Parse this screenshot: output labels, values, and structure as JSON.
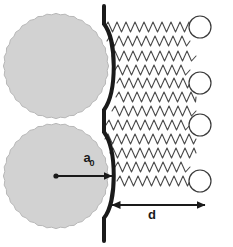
{
  "figure": {
    "width": 233,
    "height": 247,
    "background_color": "#ffffff"
  },
  "labels": {
    "radius": {
      "symbol": "a",
      "subscript": "0",
      "full": "a0",
      "x": 87,
      "y": 162
    },
    "distance": {
      "symbol": "d",
      "full": "d",
      "x": 152,
      "y": 219
    }
  },
  "colors": {
    "sphere_fill": "#d2d2d2",
    "sphere_edge": "#b8b8b8",
    "wall": "#1a1a1a",
    "chain": "#4a4a4a",
    "end_group_stroke": "#3a3a3a",
    "end_group_fill": "#ffffff",
    "arrow": "#1a1a1a",
    "label": "#1a1a1a"
  },
  "spheres": [
    {
      "name": "upper-sphere",
      "cx": 56,
      "cy": 66,
      "r": 52
    },
    {
      "name": "lower-sphere",
      "cx": 56,
      "cy": 176,
      "r": 52
    }
  ],
  "wall": {
    "name": "membrane-wall",
    "stroke_width": 4,
    "top_x": 104,
    "top_y": 6,
    "bottom_x": 104,
    "bottom_y": 241,
    "bulge_x": 117
  },
  "radius_arrow": {
    "name": "radius-arrow",
    "from_x": 56,
    "from_y": 176,
    "to_x": 112,
    "to_y": 176,
    "has_dot_origin": true,
    "head": "single"
  },
  "distance_arrow": {
    "name": "distance-arrow",
    "from_x": 112,
    "from_y": 205,
    "to_x": 205,
    "to_y": 205,
    "head": "double"
  },
  "chains": [
    {
      "index": 0,
      "y": 27,
      "start_x": 105,
      "end_x": 190,
      "amplitude": 5,
      "period": 9,
      "end_group": true
    },
    {
      "index": 1,
      "y": 41,
      "start_x": 107,
      "end_x": 190,
      "amplitude": 5,
      "period": 9,
      "end_group": false
    },
    {
      "index": 2,
      "y": 56,
      "start_x": 112,
      "end_x": 196,
      "amplitude": 5,
      "period": 9,
      "end_group": false
    },
    {
      "index": 3,
      "y": 70,
      "start_x": 115,
      "end_x": 190,
      "amplitude": 5,
      "period": 9,
      "end_group": false
    },
    {
      "index": 4,
      "y": 83,
      "start_x": 117,
      "end_x": 190,
      "amplitude": 5,
      "period": 9,
      "end_group": true
    },
    {
      "index": 5,
      "y": 97,
      "start_x": 116,
      "end_x": 196,
      "amplitude": 5,
      "period": 9,
      "end_group": false
    },
    {
      "index": 6,
      "y": 111,
      "start_x": 112,
      "end_x": 196,
      "amplitude": 5,
      "period": 9,
      "end_group": false
    },
    {
      "index": 7,
      "y": 125,
      "start_x": 106,
      "end_x": 190,
      "amplitude": 5,
      "period": 9,
      "end_group": true
    },
    {
      "index": 8,
      "y": 139,
      "start_x": 105,
      "end_x": 196,
      "amplitude": 5,
      "period": 9,
      "end_group": false
    },
    {
      "index": 9,
      "y": 153,
      "start_x": 110,
      "end_x": 196,
      "amplitude": 5,
      "period": 9,
      "end_group": false
    },
    {
      "index": 10,
      "y": 167,
      "start_x": 115,
      "end_x": 190,
      "amplitude": 5,
      "period": 9,
      "end_group": false
    },
    {
      "index": 11,
      "y": 181,
      "start_x": 117,
      "end_x": 190,
      "amplitude": 5,
      "period": 9,
      "end_group": true
    }
  ],
  "end_groups": [
    {
      "name": "end-group-circle",
      "cx": 200,
      "cy": 27,
      "r": 11
    },
    {
      "name": "end-group-circle",
      "cx": 200,
      "cy": 83,
      "r": 11
    },
    {
      "name": "end-group-circle",
      "cx": 200,
      "cy": 125,
      "r": 11
    },
    {
      "name": "end-group-circle",
      "cx": 200,
      "cy": 181,
      "r": 11
    }
  ]
}
